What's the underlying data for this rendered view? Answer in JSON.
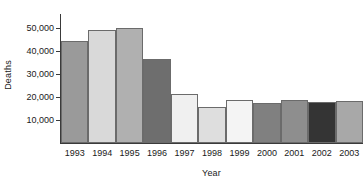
{
  "chart_data": {
    "type": "bar",
    "title": "",
    "xlabel": "Year",
    "ylabel": "Deaths",
    "categories": [
      "1993",
      "1994",
      "1995",
      "1996",
      "1997",
      "1998",
      "1999",
      "2000",
      "2001",
      "2002",
      "2003"
    ],
    "values": [
      44200,
      49100,
      50000,
      36500,
      21200,
      15500,
      18500,
      17500,
      18700,
      17700,
      18100
    ],
    "ylim": [
      0,
      56000
    ],
    "y_ticks": [
      10000,
      20000,
      30000,
      40000,
      50000
    ],
    "y_tick_labels": [
      "10,000",
      "20,000",
      "30,000",
      "40,000",
      "50,000"
    ],
    "grid": false,
    "legend": false,
    "bar_colors": [
      "#9a9a9a",
      "#d9d9d9",
      "#b0b0b0",
      "#6e6e6e",
      "#f0f0f0",
      "#dedede",
      "#f4f4f4",
      "#808080",
      "#8e8e8e",
      "#343434",
      "#a8a8a8"
    ],
    "bar_outline_color": "#6b6b6b",
    "axis_color": "#3a3a3a",
    "text_color": "#1a1a1a",
    "background": "#ffffff"
  },
  "axes": {
    "y_title": "Deaths",
    "x_title": "Year"
  }
}
